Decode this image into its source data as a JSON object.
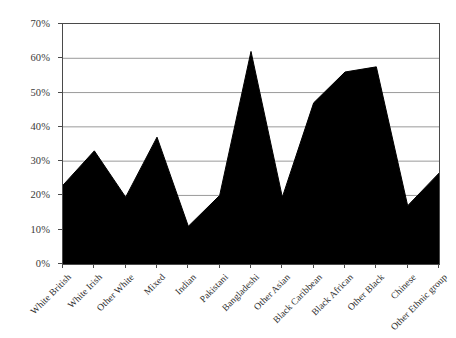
{
  "chart_data": {
    "type": "area",
    "title": "",
    "subtitle": "",
    "xlabel": "",
    "ylabel": "",
    "categories": [
      "White British",
      "White Irish",
      "Other White",
      "Mixed",
      "Indian",
      "Pakistani",
      "Bangladeshi",
      "Other Asian",
      "Black Caribbean",
      "Black African",
      "Other Black",
      "Chinese",
      "Other Ethnic group"
    ],
    "values": [
      23,
      33,
      19.5,
      37,
      11,
      20,
      62,
      19.5,
      47,
      56,
      57.5,
      17,
      26.5
    ],
    "ylim": [
      0,
      70
    ],
    "ytick_values": [
      0,
      10,
      20,
      30,
      40,
      50,
      60,
      70
    ],
    "ytick_labels": [
      "0%",
      "10%",
      "20%",
      "30%",
      "40%",
      "50%",
      "60%",
      "70%"
    ],
    "grid": true,
    "legend": null,
    "series_color": "#000000",
    "grid_color": "#9a9a9a",
    "axis_color": "#4a4a4a"
  }
}
